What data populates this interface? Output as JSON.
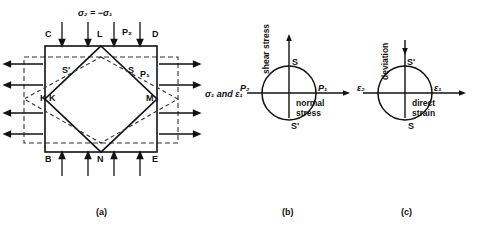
{
  "figure": {
    "title_text_top": "σ₂ = −σ₁",
    "captions": [
      {
        "key": "a",
        "text": "(a)"
      },
      {
        "key": "b",
        "text": "(b)"
      },
      {
        "key": "c",
        "text": "(c)"
      }
    ]
  },
  "panel_a": {
    "caption": "(a)",
    "square_corner_labels": {
      "top_left": "C",
      "top_right": "D",
      "bottom_left": "B",
      "bottom_right": "E"
    },
    "diamond_vertex_labels": {
      "top": "L",
      "right": "M",
      "bottom": "N",
      "left": "K"
    },
    "extra_left_vertex_label": "K",
    "midpoint_labels": {
      "upper_right": "S",
      "upper_left": "S'"
    },
    "force_labels": {
      "top": "P₂",
      "right": "P₁"
    },
    "stress_label_top": "σ₂ = −σ₁",
    "stress_label_right": "σ₁ and ε₁",
    "arrow_counts": {
      "top_inward": 4,
      "bottom_inward": 4,
      "left_outward": 4,
      "right_outward": 4
    }
  },
  "panel_b": {
    "caption": "(b)",
    "type": "mohr-circle-stress",
    "vertical_axis_label": "shear stress",
    "horizontal_axis_label": "normal stress",
    "points": {
      "left": "P₂",
      "right": "P₁",
      "top": "S",
      "bottom": "S'"
    },
    "vertical_arrow_direction": "up",
    "horizontal_arrow_direction": "right"
  },
  "panel_c": {
    "caption": "(c)",
    "type": "mohr-circle-strain",
    "vertical_axis_label": "deviation",
    "horizontal_axis_label": "direct strain",
    "points": {
      "left": "ε₂",
      "right": "ε₁",
      "top": "S'",
      "bottom": "S"
    },
    "vertical_arrow_direction": "down",
    "horizontal_arrow_direction": "right"
  },
  "colors": {
    "line": "#1a1a1a",
    "dashed": "#2b2b2b",
    "background": "#ffffff"
  }
}
